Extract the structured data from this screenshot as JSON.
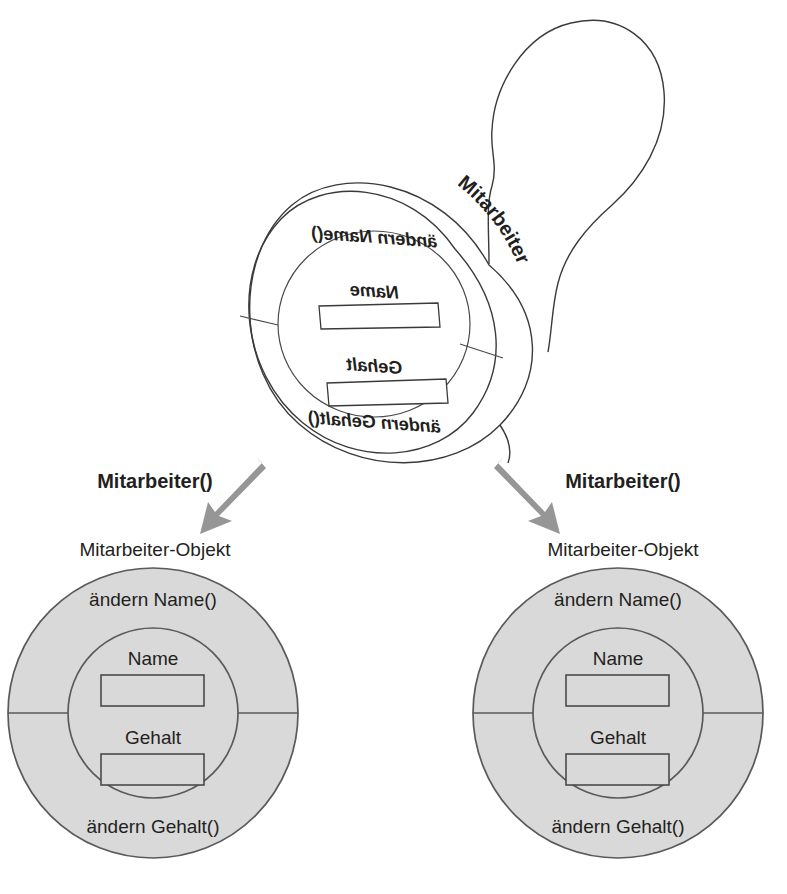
{
  "diagram": {
    "colors": {
      "object_fill": "#d9d9d9",
      "outline": "#5a5a5a",
      "arrow": "#969696",
      "text": "#231f20",
      "background": "#ffffff"
    }
  },
  "stamp": {
    "name": "stamp-mitarbeiter",
    "side_label": "Mitarbeiter",
    "face": {
      "outer_method_top": "ändern Name()",
      "outer_method_bottom": "ändern Gehalt()",
      "fields": [
        {
          "label": "Name",
          "value": ""
        },
        {
          "label": "Gehalt",
          "value": ""
        }
      ]
    }
  },
  "arrows": [
    {
      "name": "arrow-left",
      "label": "Mitarbeiter()"
    },
    {
      "name": "arrow-right",
      "label": "Mitarbeiter()"
    }
  ],
  "objects": [
    {
      "name": "mitarbeiter-objekt-left",
      "caption": "Mitarbeiter-Objekt",
      "method_top": "ändern Name()",
      "method_bottom": "ändern Gehalt()",
      "fields": [
        {
          "label": "Name",
          "value": ""
        },
        {
          "label": "Gehalt",
          "value": ""
        }
      ]
    },
    {
      "name": "mitarbeiter-objekt-right",
      "caption": "Mitarbeiter-Objekt",
      "method_top": "ändern Name()",
      "method_bottom": "ändern Gehalt()",
      "fields": [
        {
          "label": "Name",
          "value": ""
        },
        {
          "label": "Gehalt",
          "value": ""
        }
      ]
    }
  ]
}
